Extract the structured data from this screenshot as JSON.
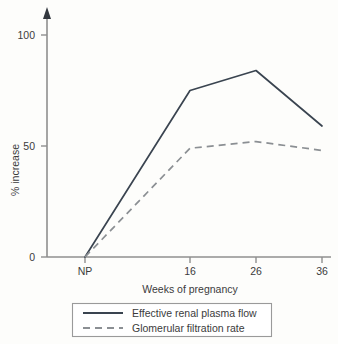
{
  "chart_data": {
    "type": "line",
    "title": "",
    "xlabel": "Weeks of pregnancy",
    "ylabel": "% increase",
    "x": [
      "NP",
      "16",
      "26",
      "36"
    ],
    "categories": [
      "NP",
      "16",
      "26",
      "36"
    ],
    "xtick_labels": [
      "NP",
      "16",
      "26",
      "36"
    ],
    "ytick_labels": [
      "0",
      "50",
      "100"
    ],
    "ytick_values": [
      0,
      50,
      100
    ],
    "ylim": [
      0,
      110
    ],
    "grid": false,
    "legend_position": "below-plot",
    "series": [
      {
        "name": "Effective renal plasma flow",
        "style": "solid",
        "color": "#3a4450",
        "values": [
          0,
          75,
          84,
          59
        ]
      },
      {
        "name": "Glomerular filtration rate",
        "style": "dashed",
        "color": "#8b8f93",
        "values": [
          0,
          49,
          52,
          48
        ]
      }
    ]
  },
  "axes": {
    "y": {
      "label": "% increase",
      "ticks": [
        {
          "label": "0",
          "value": 0
        },
        {
          "label": "50",
          "value": 50
        },
        {
          "label": "100",
          "value": 100
        }
      ],
      "arrow_at_top": true
    },
    "x": {
      "label": "Weeks of pregnancy",
      "ticks": [
        {
          "label": "NP"
        },
        {
          "label": "16"
        },
        {
          "label": "26"
        },
        {
          "label": "36"
        }
      ]
    }
  },
  "legend": {
    "entries": [
      {
        "label": "Effective renal plasma flow",
        "style": "solid"
      },
      {
        "label": "Glomerular filtration rate",
        "style": "dashed"
      }
    ]
  },
  "colors": {
    "background": "#fdfdfb",
    "axis": "#8f8f8f",
    "series_solid": "#3a4450",
    "series_dashed": "#8b8f93",
    "text": "#3b3b3b",
    "legend_border": "#9a9a9a"
  }
}
